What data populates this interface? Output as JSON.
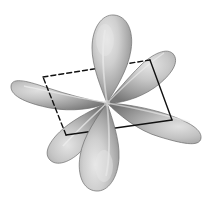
{
  "figure": {
    "type": "chemistry-orbital-illustration",
    "canvas": {
      "width": 214,
      "height": 207,
      "background_color": "#ffffff"
    },
    "center": {
      "x": 107,
      "y": 103
    },
    "palette": {
      "lobe_highlight": "#e2e2e2",
      "lobe_mid": "#b4b4b4",
      "lobe_shadow": "#7c7c7c",
      "lobe_edge": "#6a6a6a",
      "axis_streak": "#f2f2f2",
      "frame_line": "#111111",
      "background": "#ffffff"
    },
    "lobes": [
      {
        "name": "lobe-top",
        "label": "top lobe",
        "direction_deg": 270,
        "tip_x": 107,
        "tip_y": 103,
        "bulb_x": 110,
        "bulb_y": 36,
        "length": 70,
        "half_width": 23,
        "z_order": 6
      },
      {
        "name": "lobe-bottom",
        "label": "bottom lobe",
        "direction_deg": 90,
        "tip_x": 107,
        "tip_y": 103,
        "bulb_x": 104,
        "bulb_y": 172,
        "length": 70,
        "half_width": 23,
        "z_order": 6
      },
      {
        "name": "lobe-upper-left",
        "label": "upper-left lobe",
        "direction_deg": 192,
        "tip_x": 107,
        "tip_y": 103,
        "bulb_x": 31,
        "bulb_y": 82,
        "length": 78,
        "half_width": 21,
        "z_order": 3
      },
      {
        "name": "lobe-lower-right",
        "label": "lower-right lobe",
        "direction_deg": 12,
        "tip_x": 107,
        "tip_y": 103,
        "bulb_x": 183,
        "bulb_y": 124,
        "length": 78,
        "half_width": 21,
        "z_order": 5
      },
      {
        "name": "lobe-upper-right",
        "label": "upper-right lobe",
        "direction_deg": 315,
        "tip_x": 107,
        "tip_y": 103,
        "bulb_x": 158,
        "bulb_y": 64,
        "length": 66,
        "half_width": 20,
        "z_order": 4
      },
      {
        "name": "lobe-lower-left",
        "label": "lower-left lobe",
        "direction_deg": 135,
        "tip_x": 107,
        "tip_y": 103,
        "bulb_x": 57,
        "bulb_y": 142,
        "length": 66,
        "half_width": 20,
        "z_order": 2
      }
    ],
    "frame": {
      "name": "rhombic-frame",
      "label": "parallelogram frame",
      "shape": "parallelogram",
      "stroke_color": "#111111",
      "stroke_width": 1.4,
      "vertices": [
        {
          "name": "vertex-left",
          "x": 43,
          "y": 77
        },
        {
          "name": "vertex-top",
          "x": 150,
          "y": 60
        },
        {
          "name": "vertex-right",
          "x": 172,
          "y": 120
        },
        {
          "name": "vertex-bottom",
          "x": 66,
          "y": 135
        }
      ],
      "edges": [
        {
          "name": "edge-left-to-top",
          "from": "vertex-left",
          "to": "vertex-top",
          "style": "dashed"
        },
        {
          "name": "edge-top-to-right",
          "from": "vertex-top",
          "to": "vertex-right",
          "style": "solid"
        },
        {
          "name": "edge-right-to-bottom",
          "from": "vertex-right",
          "to": "vertex-bottom",
          "style": "solid"
        },
        {
          "name": "edge-bottom-to-left",
          "from": "vertex-bottom",
          "to": "vertex-left",
          "style": "dashed"
        }
      ],
      "dash_pattern": "5 3"
    }
  }
}
